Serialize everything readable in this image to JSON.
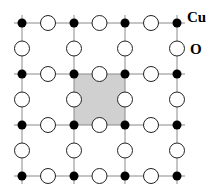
{
  "diagram": {
    "labels": {
      "cu": "Cu",
      "o": "O"
    },
    "grid": {
      "cu_x": [
        22,
        74,
        125,
        177
      ],
      "cu_y": [
        23,
        74,
        125,
        176
      ],
      "cu_radius": 4.5,
      "o_radius": 7.5,
      "line_overhang": 8
    },
    "unit_cell": {
      "x1": 74,
      "y1": 74,
      "x2": 125,
      "y2": 125
    },
    "colors": {
      "line": "#8a8a8a",
      "cu_fill": "#000000",
      "o_fill": "#ffffff",
      "o_stroke": "#222222",
      "cell_fill": "#d0d0d0"
    }
  }
}
